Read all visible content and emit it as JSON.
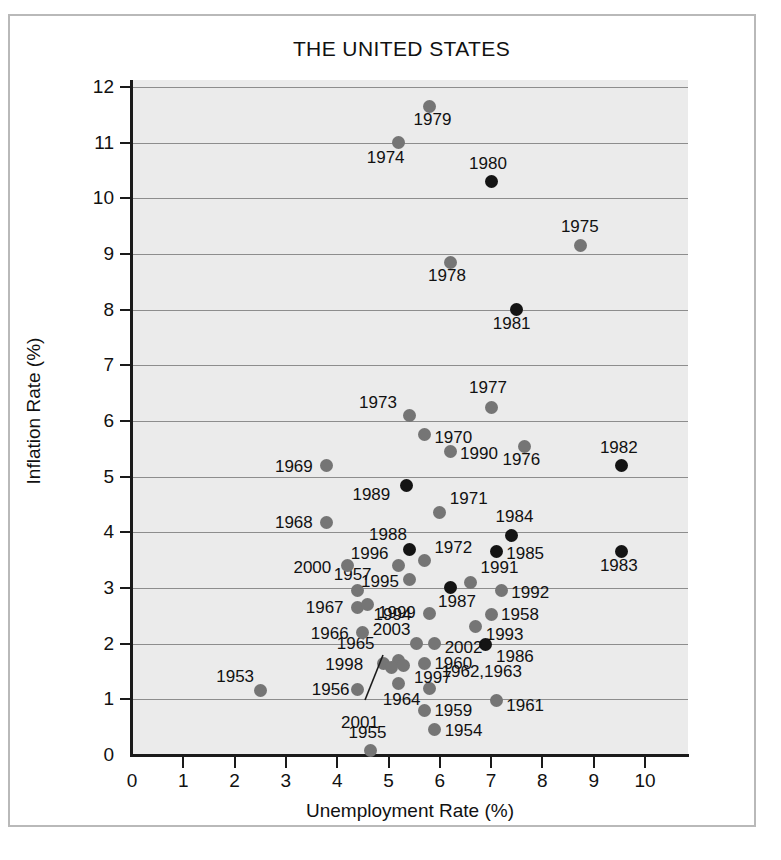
{
  "chart_data": {
    "type": "scatter",
    "title": "THE UNITED STATES",
    "xlabel": "Unemployment Rate (%)",
    "ylabel": "Inflation Rate (%)",
    "xlim": [
      0,
      10.4
    ],
    "ylim": [
      0,
      12.2
    ],
    "xticks": [
      0,
      1,
      2,
      3,
      4,
      5,
      6,
      7,
      8,
      9,
      10
    ],
    "yticks": [
      0,
      1,
      2,
      3,
      4,
      5,
      6,
      7,
      8,
      9,
      10,
      11,
      12
    ],
    "grid": "horizontal",
    "legend": "none",
    "colors": {
      "gray_point": "#757575",
      "black_point": "#141414",
      "plot_background": "#ebebeb",
      "gridline": "#8d8d8d",
      "axis": "#1a1a1a"
    },
    "series": [
      {
        "name": "gray-years",
        "color": "#757575"
      },
      {
        "name": "black-years",
        "color": "#141414"
      }
    ],
    "points": [
      {
        "label": "1953",
        "x": 2.5,
        "y": 1.15,
        "color": "gray",
        "lx": -44,
        "ly": -24
      },
      {
        "label": "1954",
        "x": 5.9,
        "y": 0.45,
        "color": "gray",
        "lx": 10,
        "ly": -9
      },
      {
        "label": "1955",
        "x": 4.65,
        "y": 0.08,
        "color": "gray",
        "lx": -22,
        "ly": -28
      },
      {
        "label": "1956",
        "x": 4.4,
        "y": 1.18,
        "color": "gray",
        "lx": -46,
        "ly": -9
      },
      {
        "label": "1957",
        "x": 4.4,
        "y": 2.95,
        "color": "gray",
        "lx": -24,
        "ly": -26
      },
      {
        "label": "1958",
        "x": 7.0,
        "y": 2.53,
        "color": "gray",
        "lx": 10,
        "ly": -9
      },
      {
        "label": "1959",
        "x": 5.7,
        "y": 0.8,
        "color": "gray",
        "lx": 10,
        "ly": -9
      },
      {
        "label": "1960",
        "x": 5.7,
        "y": 1.65,
        "color": "gray",
        "lx": 10,
        "ly": -9
      },
      {
        "label": "1961",
        "x": 7.1,
        "y": 0.98,
        "color": "gray",
        "lx": 10,
        "ly": -4
      },
      {
        "label": "1962,1963",
        "x": 5.8,
        "y": 1.2,
        "color": "gray",
        "lx": 12,
        "ly": -26
      },
      {
        "label": "1964",
        "x": 5.2,
        "y": 1.28,
        "color": "gray",
        "lx": -16,
        "ly": 6
      },
      {
        "label": "1965",
        "x": 5.2,
        "y": 1.7,
        "color": "gray",
        "lx": -62,
        "ly": -26
      },
      {
        "label": "1966",
        "x": 4.5,
        "y": 2.2,
        "color": "gray",
        "lx": -52,
        "ly": -9
      },
      {
        "label": "1967",
        "x": 4.4,
        "y": 2.65,
        "color": "gray",
        "lx": -52,
        "ly": -9
      },
      {
        "label": "1968",
        "x": 3.8,
        "y": 4.18,
        "color": "gray",
        "lx": -52,
        "ly": -9
      },
      {
        "label": "1969",
        "x": 3.8,
        "y": 5.2,
        "color": "gray",
        "lx": -52,
        "ly": -9
      },
      {
        "label": "1970",
        "x": 5.7,
        "y": 5.75,
        "color": "gray",
        "lx": 10,
        "ly": -7
      },
      {
        "label": "1971",
        "x": 6.0,
        "y": 4.35,
        "color": "gray",
        "lx": 10,
        "ly": -24
      },
      {
        "label": "1972",
        "x": 5.7,
        "y": 3.5,
        "color": "gray",
        "lx": 10,
        "ly": -22
      },
      {
        "label": "1973",
        "x": 5.4,
        "y": 6.1,
        "color": "gray",
        "lx": -50,
        "ly": -22
      },
      {
        "label": "1974",
        "x": 5.2,
        "y": 11.0,
        "color": "gray",
        "lx": -32,
        "ly": 5
      },
      {
        "label": "1975",
        "x": 8.75,
        "y": 9.15,
        "color": "gray",
        "lx": -20,
        "ly": -29
      },
      {
        "label": "1976",
        "x": 7.65,
        "y": 5.55,
        "color": "gray",
        "lx": -22,
        "ly": 4
      },
      {
        "label": "1977",
        "x": 7.0,
        "y": 6.25,
        "color": "gray",
        "lx": -22,
        "ly": -29
      },
      {
        "label": "1978",
        "x": 6.2,
        "y": 8.85,
        "color": "gray",
        "lx": -22,
        "ly": 4
      },
      {
        "label": "1979",
        "x": 5.8,
        "y": 11.65,
        "color": "gray",
        "lx": -16,
        "ly": 4
      },
      {
        "label": "1980",
        "x": 7.0,
        "y": 10.3,
        "color": "black",
        "lx": -22,
        "ly": -28
      },
      {
        "label": "1981",
        "x": 7.5,
        "y": 8.0,
        "color": "black",
        "lx": -24,
        "ly": 4
      },
      {
        "label": "1982",
        "x": 9.55,
        "y": 5.2,
        "color": "black",
        "lx": -22,
        "ly": -28
      },
      {
        "label": "1983",
        "x": 9.55,
        "y": 3.65,
        "color": "black",
        "lx": -22,
        "ly": 4
      },
      {
        "label": "1984",
        "x": 7.4,
        "y": 3.95,
        "color": "black",
        "lx": -16,
        "ly": -28
      },
      {
        "label": "1985",
        "x": 7.1,
        "y": 3.65,
        "color": "black",
        "lx": 10,
        "ly": -8
      },
      {
        "label": "1986",
        "x": 6.9,
        "y": 1.98,
        "color": "black",
        "lx": 10,
        "ly": 2
      },
      {
        "label": "1987",
        "x": 6.2,
        "y": 3.0,
        "color": "black",
        "lx": -12,
        "ly": 4
      },
      {
        "label": "1988",
        "x": 5.4,
        "y": 3.7,
        "color": "black",
        "lx": -40,
        "ly": -24
      },
      {
        "label": "1989",
        "x": 5.35,
        "y": 4.85,
        "color": "black",
        "lx": -54,
        "ly": 0
      },
      {
        "label": "1990",
        "x": 6.2,
        "y": 5.45,
        "color": "gray",
        "lx": 10,
        "ly": -8
      },
      {
        "label": "1991",
        "x": 6.6,
        "y": 3.1,
        "color": "gray",
        "lx": 10,
        "ly": -24
      },
      {
        "label": "1992",
        "x": 7.2,
        "y": 2.95,
        "color": "gray",
        "lx": 10,
        "ly": -8
      },
      {
        "label": "1993",
        "x": 6.7,
        "y": 2.3,
        "color": "gray",
        "lx": 10,
        "ly": -2
      },
      {
        "label": "1994",
        "x": 5.8,
        "y": 2.55,
        "color": "gray",
        "lx": -56,
        "ly": -8
      },
      {
        "label": "1995",
        "x": 5.4,
        "y": 3.15,
        "color": "gray",
        "lx": -48,
        "ly": -8
      },
      {
        "label": "1996",
        "x": 5.2,
        "y": 3.4,
        "color": "gray",
        "lx": -48,
        "ly": -22
      },
      {
        "label": "1997",
        "x": 5.3,
        "y": 1.6,
        "color": "gray",
        "lx": 10,
        "ly": 2
      },
      {
        "label": "1998",
        "x": 4.9,
        "y": 1.65,
        "color": "gray",
        "lx": -58,
        "ly": -8
      },
      {
        "label": "1999",
        "x": 4.6,
        "y": 2.7,
        "color": "gray",
        "lx": 10,
        "ly": -2
      },
      {
        "label": "2000",
        "x": 4.2,
        "y": 3.4,
        "color": "gray",
        "lx": -54,
        "ly": -8
      },
      {
        "label": "2001",
        "x": 5.05,
        "y": 1.58,
        "color": "gray",
        "lx": -50,
        "ly": 46
      },
      {
        "label": "2002",
        "x": 5.9,
        "y": 2.0,
        "color": "gray",
        "lx": 10,
        "ly": -6
      },
      {
        "label": "2003",
        "x": 5.55,
        "y": 2.0,
        "color": "gray",
        "lx": -44,
        "ly": -24
      }
    ]
  }
}
